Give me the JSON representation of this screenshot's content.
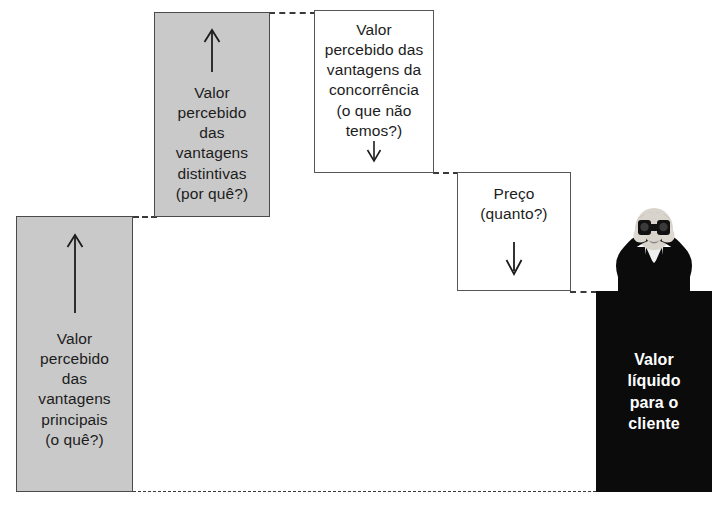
{
  "diagram": {
    "title": "",
    "language": "pt-BR",
    "background_color": "#ffffff",
    "colors": {
      "gray_fill": "#c9c9c9",
      "gray_border": "#4a4a4a",
      "white_fill": "#ffffff",
      "white_border": "#555555",
      "black_fill": "#0b0b0b",
      "white_text": "#ffffff",
      "dark_text": "#1c1c1c",
      "dashed_line": "#3a3a3a"
    },
    "steps": [
      {
        "id": "valor-vantagens-principais",
        "label": "Valor\npercebido\ndas\nvantagens\nprincipais\n(o quê?)",
        "style": "gray",
        "arrow": "up",
        "arrow_position": "above-text"
      },
      {
        "id": "valor-vantagens-distintivas",
        "label": "Valor\npercebido\ndas\nvantagens\ndistintivas\n(por quê?)",
        "style": "gray",
        "arrow": "up",
        "arrow_position": "above-text"
      },
      {
        "id": "valor-vantagens-concorrencia",
        "label": "Valor\npercebido das\nvantagens da\nconcorrência\n(o que não\ntemos?)",
        "style": "white",
        "arrow": "down",
        "arrow_position": "below-text"
      },
      {
        "id": "preco",
        "label": "Preço\n(quanto?)",
        "style": "white",
        "arrow": "down",
        "arrow_position": "below-text"
      },
      {
        "id": "valor-liquido-cliente",
        "label": "Valor\nlíquido\npara o\ncliente",
        "style": "black",
        "arrow": "none",
        "arrow_position": "none"
      }
    ],
    "illustration": {
      "id": "person-with-binoculars",
      "description": "person in dark suit holding binoculars to eyes"
    },
    "connectors": [
      {
        "id": "connector-1",
        "from": "valor-vantagens-principais",
        "to": "valor-vantagens-distintivas"
      },
      {
        "id": "connector-2",
        "from": "valor-vantagens-distintivas",
        "to": "valor-vantagens-concorrencia"
      },
      {
        "id": "connector-3",
        "from": "valor-vantagens-concorrencia",
        "to": "preco"
      },
      {
        "id": "connector-4",
        "from": "preco",
        "to": "valor-liquido-cliente"
      },
      {
        "id": "connector-baseline",
        "from": "valor-vantagens-principais",
        "to": "valor-liquido-cliente"
      }
    ]
  }
}
